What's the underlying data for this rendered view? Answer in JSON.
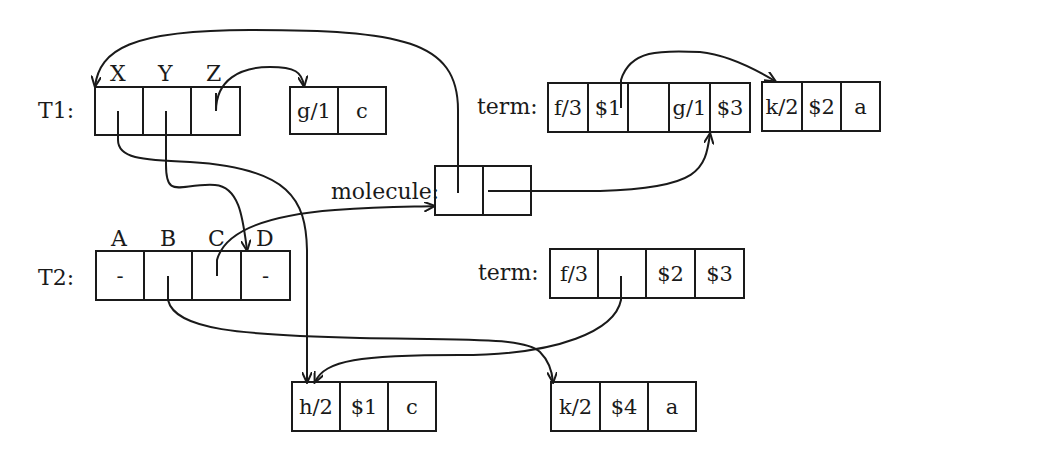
{
  "t1": {
    "label": "T1:",
    "headers": [
      "X",
      "Y",
      "Z"
    ],
    "cells": [
      "",
      "",
      ""
    ]
  },
  "g1_struct": {
    "cells": [
      "g/1",
      "c"
    ]
  },
  "t2": {
    "label": "T2:",
    "headers": [
      "A",
      "B",
      "C",
      "D"
    ],
    "cells": [
      "-",
      "",
      "",
      "-"
    ]
  },
  "molecule": {
    "label": "molecule:",
    "cells": [
      "",
      ""
    ]
  },
  "term1": {
    "label": "term:",
    "cells": [
      "f/3",
      "$1",
      "",
      "g/1",
      "$3"
    ]
  },
  "k2_top": {
    "cells": [
      "k/2",
      "$2",
      "a"
    ]
  },
  "term2": {
    "label": "term:",
    "cells": [
      "f/3",
      "",
      "$2",
      "$3"
    ]
  },
  "h2_struct": {
    "cells": [
      "h/2",
      "$1",
      "c"
    ]
  },
  "k2_bottom": {
    "cells": [
      "k/2",
      "$4",
      "a"
    ]
  }
}
